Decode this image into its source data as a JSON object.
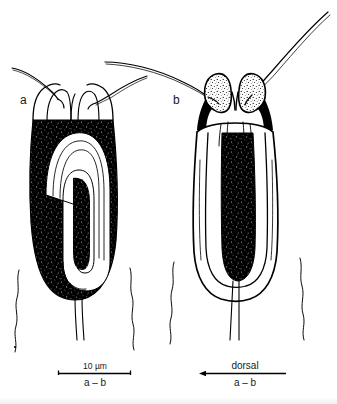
{
  "figure": {
    "domain": "scientific-line-drawing",
    "background_color": "#ffffff",
    "ink_color": "#000000",
    "width": 337,
    "height": 404,
    "panels": [
      {
        "id": "a",
        "label": "a",
        "label_x": 20,
        "label_y": 104,
        "view": "lateral",
        "description": "loricate organism, lateral aspect, body densely stippled black with white U-shaped internal loop",
        "body_fill": "stipple-black",
        "setae_count": 2,
        "tail_setae_count": 2
      },
      {
        "id": "b",
        "label": "b",
        "label_x": 173,
        "label_y": 104,
        "view": "dorsal",
        "description": "loricate organism, dorsal aspect, outlined body with central elongate stippled black mass and two stippled head lobes",
        "body_fill": "outline-with-central-stipple",
        "setae_count": 2,
        "tail_setae_count": 2
      }
    ],
    "scale_bars": [
      {
        "id": "scale-bar-left",
        "above_label": "10 µm",
        "below_label": "a – b",
        "x_start": 58,
        "x_end": 131,
        "y": 373,
        "has_arrowhead": false,
        "end_ticks": true
      },
      {
        "id": "orientation-bar-right",
        "above_label": "dorsal",
        "below_label": "a – b",
        "x_start": 200,
        "x_end": 286,
        "y": 373,
        "has_arrowhead": true,
        "arrowhead_side": "left",
        "end_ticks": false
      }
    ]
  }
}
